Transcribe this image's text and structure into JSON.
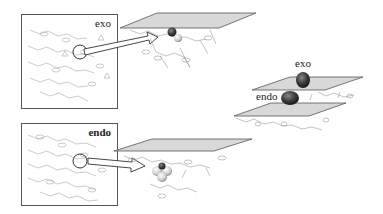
{
  "figure": {
    "panels": [
      {
        "id": "exo",
        "label": "exo"
      },
      {
        "id": "endo",
        "label": "endo"
      }
    ],
    "stack": {
      "top_label": "exo",
      "bottom_label": "endo"
    }
  },
  "colors": {
    "plane_fill": "#d8d8d8",
    "plane_edge": "#555555",
    "sphere_dark": "#3a3a3a",
    "molecule_line": "#9a9a9a",
    "border": "#555555"
  }
}
